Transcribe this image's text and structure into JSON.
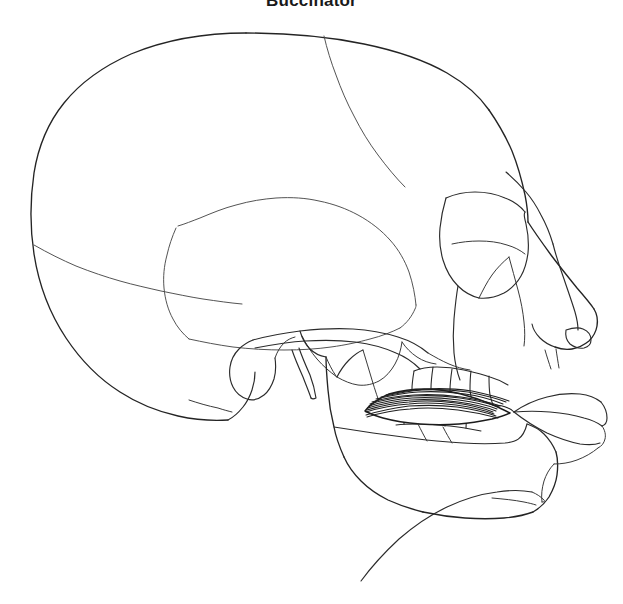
{
  "figure": {
    "title": "Buccinator",
    "background_color": "#ffffff",
    "line_color": "#2b2b2b",
    "suture_color": "#4a4a4a",
    "muscle_color": "#1f1f1f",
    "width": 623,
    "height": 604
  },
  "labels": {
    "cranial_vault": "cranial-vault",
    "frontal_bone": "frontal-bone",
    "parietal_bone": "parietal-bone",
    "occipital_bone": "occipital-bone",
    "temporal_bone": "temporal-bone",
    "coronal_suture": "coronal-suture",
    "lambdoid_suture": "lambdoid-suture",
    "squamosal_suture": "squamosal-suture",
    "zygomatic_arch": "zygomatic-arch",
    "orbit": "orbit",
    "nasal_bone": "nasal-bone",
    "nasal_aperture": "nasal-aperture",
    "maxilla": "maxilla",
    "mandible": "mandible",
    "mandibular_ramus": "mandibular-ramus",
    "coronoid_process": "coronoid-process",
    "condylar_process": "condylar-process",
    "mastoid_process": "mastoid-process",
    "styloid_process": "styloid-process",
    "upper_teeth": "upper-teeth",
    "lower_teeth": "lower-teeth",
    "lips": "lips",
    "neck_contour": "neck-contour",
    "muscle": "buccinator-muscle",
    "muscle_fibers": "buccinator-fibers"
  },
  "muscle": {
    "name": "Buccinator",
    "fiber_count": 11,
    "origin": "alveolar processes of maxilla and mandible",
    "insertion": "angle of the mouth"
  }
}
